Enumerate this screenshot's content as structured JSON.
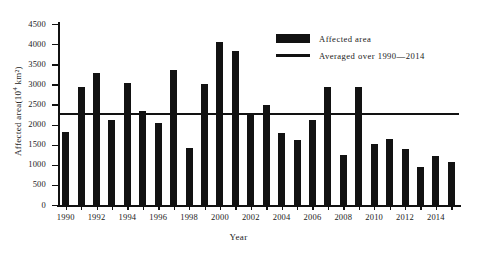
{
  "chart_data": {
    "type": "bar",
    "title": "",
    "xlabel": "Year",
    "ylabel": "Affected area(10⁴ km²)",
    "ylabel_text": "Affected area(10",
    "ylabel_exp": "4",
    "ylabel_tail": " km²)",
    "ylim": [
      0,
      4500
    ],
    "ytick_step": 500,
    "yticks": [
      0,
      500,
      1000,
      1500,
      2000,
      2500,
      3000,
      3500,
      4000,
      4500
    ],
    "xticks_major": [
      1990,
      1992,
      1994,
      1996,
      1998,
      2000,
      2002,
      2004,
      2006,
      2008,
      2010,
      2012,
      2014
    ],
    "grid": false,
    "legend_position": "upper-right",
    "categories": [
      1990,
      1991,
      1992,
      1993,
      1994,
      1995,
      1996,
      1997,
      1998,
      1999,
      2000,
      2001,
      2002,
      2003,
      2004,
      2005,
      2006,
      2007,
      2008,
      2009,
      2010,
      2011,
      2012,
      2013,
      2014,
      2015
    ],
    "series": [
      {
        "name": "Affected area",
        "color": "#121212",
        "values": [
          1815,
          2940,
          3290,
          2120,
          3040,
          2340,
          2030,
          3350,
          1420,
          3020,
          4050,
          3840,
          2230,
          2490,
          1790,
          1620,
          2120,
          2930,
          1240,
          2930,
          1520,
          1650,
          1390,
          950,
          1210,
          1060
        ]
      }
    ],
    "reference_line": {
      "name": "Averaged over 1990—2014",
      "value": 2260,
      "color": "#121212"
    },
    "legend": [
      {
        "label": "Affected area",
        "marker": "bar-swatch"
      },
      {
        "label": "Averaged over 1990—2014",
        "marker": "line-swatch"
      }
    ]
  }
}
